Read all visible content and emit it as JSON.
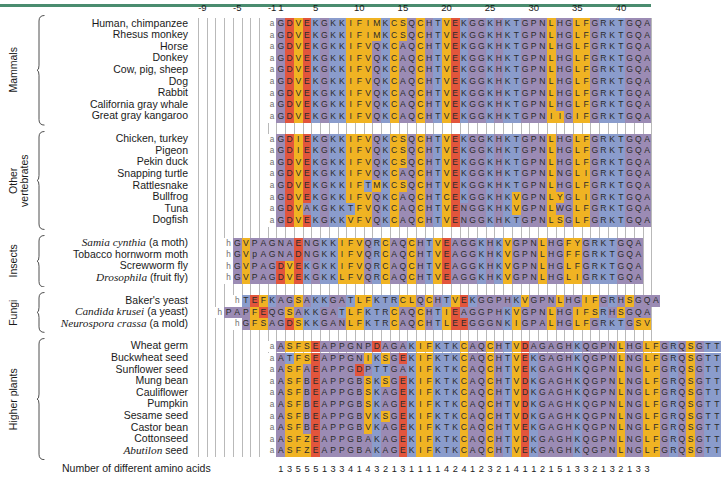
{
  "figure": {
    "footnote": "Number of different amino acids",
    "axis_ticks": [
      {
        "label": "-9",
        "pos": -9
      },
      {
        "label": "-5",
        "pos": -5
      },
      {
        "label": "-1",
        "pos": -1
      },
      {
        "label": "1",
        "pos": 1
      },
      {
        "label": "5",
        "pos": 5
      },
      {
        "label": "10",
        "pos": 10
      },
      {
        "label": "15",
        "pos": 15
      },
      {
        "label": "20",
        "pos": 20
      },
      {
        "label": "25",
        "pos": 25
      },
      {
        "label": "30",
        "pos": 30
      },
      {
        "label": "35",
        "pos": 35
      },
      {
        "label": "40",
        "pos": 40
      }
    ],
    "colors": {
      "rule": "#4a8c6f",
      "gridline": "#b9b9b9",
      "orange": "#f0b323",
      "blue": "#8a9ccc",
      "purple": "#9b8bb4",
      "red": "#e2553c",
      "white": "#ffffff",
      "text": "#1a1a1a"
    },
    "residue_colors": {
      "G": "#9b8bb4",
      "D": "#e2553c",
      "V": "#f0b323",
      "E": "#e2553c",
      "K": "#8a9ccc",
      "I": "#f0b323",
      "F": "#f0b323",
      "M": "#f0b323",
      "C": "#f0b323",
      "S": "#f0b323",
      "Q": "#9b8bb4",
      "H": "#9b8bb4",
      "T": "#8a9ccc",
      "N": "#9b8bb4",
      "L": "#f0b323",
      "P": "#9b8bb4",
      "R": "#8a9ccc",
      "A": "#9b8bb4",
      "Y": "#f0b323",
      "W": "#9b8bb4",
      "B": "#9b8bb4",
      "Z": "#f0b323"
    }
  },
  "groups": [
    {
      "name": "Mammals",
      "label": "Mammals",
      "rows": [
        {
          "species": "Human, chimpanzee",
          "italic": false,
          "lead": "a",
          "start": 1,
          "seq": "GDVEKGKKIFIMKCSQCHTVEKGGKHKTGPNLHGLFGRKTGQA"
        },
        {
          "species": "Rhesus monkey",
          "italic": false,
          "lead": "a",
          "start": 1,
          "seq": "GDVEKGKKIFIMKCSQCHTVEKGGKHKTGPNLHGLFGRKTGQA"
        },
        {
          "species": "Horse",
          "italic": false,
          "lead": "a",
          "start": 1,
          "seq": "GDVEKGKKIFVQKCAQCHTVEKGGKHKTGPNLHGLFGRKTGQA"
        },
        {
          "species": "Donkey",
          "italic": false,
          "lead": "a",
          "start": 1,
          "seq": "GDVEKGKKIFVQKCAQCHTVEKGGKHKTGPNLHGLFGRKTGQA"
        },
        {
          "species": "Cow, pig, sheep",
          "italic": false,
          "lead": "a",
          "start": 1,
          "seq": "GDVEKGKKIFVQKCAQCHTVEKGGKHKTGPNLHGLFGRKTGQA"
        },
        {
          "species": "Dog",
          "italic": false,
          "lead": "a",
          "start": 1,
          "seq": "GDVEKGKKIFVQKCAQCHTVEKGGKHKTGPNLHGLFGRKTGQA"
        },
        {
          "species": "Rabbit",
          "italic": false,
          "lead": "a",
          "start": 1,
          "seq": "GDVEKGKKIFVQKCAQCHTVEKGGKHKTGPNLHGLFGRKTGQA"
        },
        {
          "species": "California gray whale",
          "italic": false,
          "lead": "a",
          "start": 1,
          "seq": "GDVEKGKKIFVQKCAQCHTVEKGGKHKTGPNLHGLFGRKTGQA"
        },
        {
          "species": "Great gray kangaroo",
          "italic": false,
          "lead": "a",
          "start": 1,
          "seq": "GDVEKGKKIFVQKCAQCHTVEKGGKHKTGPNIIGIFGRKTGQA"
        }
      ]
    },
    {
      "name": "Other vertebrates",
      "label": "Other\nvertebrates",
      "rows": [
        {
          "species": "Chicken, turkey",
          "italic": false,
          "lead": "a",
          "start": 1,
          "seq": "GDIEKGKKIFVQKCSQCHTVEKGGKHKTGPNLHGLFGRKTGQA"
        },
        {
          "species": "Pigeon",
          "italic": false,
          "lead": "a",
          "start": 1,
          "seq": "GDIEKGKKIFVQKCSQCHTVEKGGKHKTGPNLHGLFGRKTGQA"
        },
        {
          "species": "Pekin duck",
          "italic": false,
          "lead": "a",
          "start": 1,
          "seq": "GDVEKGKKIFVQKCSQCHTVEKGGKHKTGPNLHGLFGRKTGQA"
        },
        {
          "species": "Snapping turtle",
          "italic": false,
          "lead": "a",
          "start": 1,
          "seq": "GDVEKGKKIFVQKCAQCHTVEKGGKHKTGPNLNGLIGRKTGQA"
        },
        {
          "species": "Rattlesnake",
          "italic": false,
          "lead": "a",
          "start": 1,
          "seq": "GDVEKGKKIFTMKCSQCHTVEKGGKHKTGPNLHGLFGRKTGQA"
        },
        {
          "species": "Bullfrog",
          "italic": false,
          "lead": "a",
          "start": 1,
          "seq": "GDVEKGKKIFVQKCAQCHTCEKGGKHKVGPNLYGLIGRKTGQA"
        },
        {
          "species": "Tuna",
          "italic": false,
          "lead": "a",
          "start": 1,
          "seq": "GDVAKGKKTFVQKCAQCHTVENGGKHKVGPNLWGLFGRKTGQA"
        },
        {
          "species": "Dogfish",
          "italic": false,
          "lead": "a",
          "start": 1,
          "seq": "GDVEKGKKVFVQKCAQCHTVENGGKHKTGPNLSGLFGRKTGQA"
        }
      ]
    },
    {
      "name": "Insects",
      "label": "Insects",
      "rows": [
        {
          "species": "Samia cynthia (a moth)",
          "italic": true,
          "italic_part": "Samia cynthia",
          "rest": " (a moth)",
          "lead": "h",
          "start": -5,
          "seq": "GVPAGNAENGKKIFVQRCAQCHTVEAGGKHKVGPNLHGFYGRKTGQA"
        },
        {
          "species": "Tobacco hornworm moth",
          "italic": false,
          "lead": "h",
          "start": -5,
          "seq": "GVpAGNADNGKKIFVQRCAQCHTVEAGGKHKVGPNLHGFFGRKTGQA"
        },
        {
          "species": "Screwworm fly",
          "italic": false,
          "lead": "h",
          "start": -5,
          "seq": "GVPAGDVEKGKKIFVQRCAQCHTVEAGGKHKVGPNLHGLFGRKTGQA"
        },
        {
          "species": "Drosophila (fruit fly)",
          "italic": true,
          "italic_part": "Drosophila",
          "rest": " (fruit fly)",
          "lead": "h",
          "start": -5,
          "seq": "GVPAGDVEKGKKLFVQRCAQCHTVEAGGKHKVGPNLHGLIGRKTGQA"
        }
      ]
    },
    {
      "name": "Fungi",
      "label": "Fungi",
      "rows": [
        {
          "species": "Baker's yeast",
          "italic": false,
          "lead": "h",
          "start": -4,
          "seq": "TEFKAGSAKKGATLFKTRCLQCHTVEKGGPHKVGPNLHGIFGRHSGQA"
        },
        {
          "species": "Candida krusei (a yeast)",
          "italic": true,
          "italic_part": "Candida krusei",
          "rest": " (a yeast)",
          "lead": "h",
          "start": -6,
          "seq": "PAPFEQGSAKKGATLFKTRCAQCHTIEAGGPHKVGPNLHGIFSRHSGQA"
        },
        {
          "species": "Neurospora crassa (a mold)",
          "italic": true,
          "italic_part": "Neurospora crassa",
          "rest": " (a mold)",
          "lead": "h",
          "start": -4,
          "seq": "GFSAGDSKKGANLFKTRCAQCHTLEEGGGNKIGPALHGLFGRKTGSV"
        }
      ]
    },
    {
      "name": "Higher plants",
      "label": "Higher plants",
      "rows": [
        {
          "species": "Wheat germ",
          "italic": false,
          "lead": "a",
          "start": 1,
          "seq": "ASFSEAPPGNPDAGAKIFKTKCAQCHTVDAGAGHKQGPNLHGLFGRQSGTT"
        },
        {
          "species": "Buckwheat seed",
          "italic": false,
          "lead": "a",
          "start": 1,
          "seq": "ATFSEAPPGNIKSGEKIFKTKCAQCHTVEKGAGHKQGPNLNGLFGRQSGTT"
        },
        {
          "species": "Sunflower seed",
          "italic": false,
          "lead": "a",
          "start": 1,
          "seq": "ASFAEAPPGDPTTGAKIFKTKCAQCHTVEKGAGHKQGPNLNGLFGRQSGTT"
        },
        {
          "species": "Mung bean",
          "italic": false,
          "lead": "a",
          "start": 1,
          "seq": "ASFBEAPPGBSKSGEKIFKTKCAQCHTVDKGAGHKQGPNLNGLFGRQSGTT"
        },
        {
          "species": "Cauliflower",
          "italic": false,
          "lead": "a",
          "start": 1,
          "seq": "ASFBEAPPGBSKAGEKIFKTKCAQCHTVDKGAGHKQGPNLNGLFGRQSGTT"
        },
        {
          "species": "Pumpkin",
          "italic": false,
          "lead": "a",
          "start": 1,
          "seq": "ASFBEAPPGBSKAGEKIFKTKCAQCHTVDKGAGHKQGPNLNGLFGRQSGTT"
        },
        {
          "species": "Sesame seed",
          "italic": false,
          "lead": "a",
          "start": 1,
          "seq": "ASFBEAPPGBVKSGEKIFKTKCAQCHTVDKGAGHKQGPNLNGLFGRQSGTT"
        },
        {
          "species": "Castor bean",
          "italic": false,
          "lead": "a",
          "start": 1,
          "seq": "ASFBEAPPGBVKAGEKIFKTKCAQCHTVEKGAGHKQGPNLNGLFGRQSGTT"
        },
        {
          "species": "Cottonseed",
          "italic": false,
          "lead": "a",
          "start": 1,
          "seq": "ASFZEAPPGBAKAGEKIFKTKCAQCHTVDKGAGHKQGPNLNGLFGRQSGTT"
        },
        {
          "species": "Abutilon seed",
          "italic": true,
          "italic_part": "Abutilon",
          "rest": " seed",
          "lead": "a",
          "start": 1,
          "seq": "ASFZEAPPGBAKAGEKIFKTKCAQCHTVEKGAGHKQGPNLNGLFGRQSGTT"
        }
      ]
    }
  ],
  "counts": {
    "start": 1,
    "values": [
      1,
      3,
      5,
      5,
      5,
      1,
      3,
      3,
      4,
      1,
      4,
      3,
      2,
      1,
      3,
      1,
      1,
      1,
      1,
      4,
      2,
      4,
      1,
      2,
      3,
      2,
      1,
      4,
      1,
      1,
      2,
      1,
      5,
      1,
      3,
      3,
      2,
      1,
      3,
      2,
      1,
      3,
      3
    ]
  }
}
